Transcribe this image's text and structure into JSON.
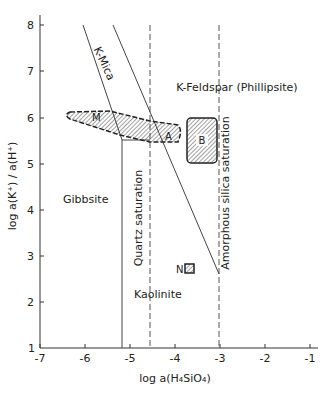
{
  "diagram": {
    "type": "stability-diagram",
    "xlabel": "log a(H₄SiO₄)",
    "ylabel": "log a(K⁺) / a(H⁺)",
    "x_ticks": [
      "-7",
      "-6",
      "-5",
      "-4",
      "-3",
      "-2",
      "-1"
    ],
    "y_ticks": [
      "1",
      "2",
      "3",
      "4",
      "5",
      "6",
      "7",
      "8"
    ],
    "xlim": [
      -7,
      -1
    ],
    "ylim": [
      1,
      8
    ],
    "fields": {
      "gibbsite": "Gibbsite",
      "kaolinite": "Kaolinite",
      "k_mica": "K-Mica",
      "k_feldspar": "K-Feldspar (Phillipsite)"
    },
    "saturation_lines": {
      "quartz": "Quartz saturation",
      "amorphous": "Amorphous silica saturation"
    },
    "samples": {
      "m": "M",
      "a": "A",
      "b": "B",
      "n": "N"
    }
  }
}
